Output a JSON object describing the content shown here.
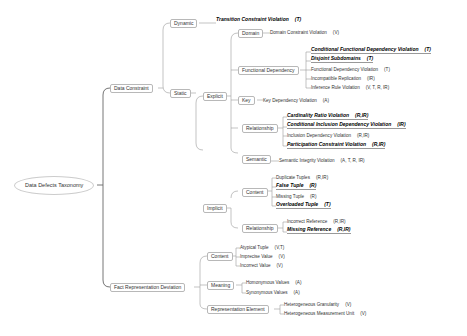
{
  "root": "Data Defects Taxonomy",
  "data_constraint": {
    "label": "Data Constraint",
    "dynamic": {
      "label": "Dynamic",
      "leaves": [
        {
          "text": "Transition Constraint Violation",
          "tag": "(T)",
          "bold": true
        }
      ]
    },
    "static": {
      "label": "Static",
      "explicit": {
        "label": "Explicit",
        "domain": {
          "label": "Domain",
          "leaves": [
            {
              "text": "Domain Constraint Violation",
              "tag": "(V)",
              "bold": false
            }
          ]
        },
        "functional_dependency": {
          "label": "Functional Dependency",
          "leaves": [
            {
              "text": "Conditional Functional Dependency Violation",
              "tag": "(T)",
              "bold": true
            },
            {
              "text": "Disjoint Subdomains",
              "tag": "(T)",
              "bold": true
            },
            {
              "text": "Functional Dependency Violation",
              "tag": "(T)",
              "bold": false
            },
            {
              "text": "Incompatible Replication",
              "tag": "(IR)",
              "bold": false
            },
            {
              "text": "Inference Rule Violation",
              "tag": "(V, T, R, IR)",
              "bold": false
            }
          ]
        },
        "key": {
          "label": "Key",
          "leaves": [
            {
              "text": "Key Dependency Violation",
              "tag": "(A)",
              "bold": false
            }
          ]
        },
        "relationship": {
          "label": "Relationship",
          "leaves": [
            {
              "text": "Cardinality Ratio Violation",
              "tag": "(R,IR)",
              "bold": true
            },
            {
              "text": "Conditional Inclusion Dependency Violation",
              "tag": "(IR)",
              "bold": true
            },
            {
              "text": "Inclusion Dependency Violation",
              "tag": "(R,IR)",
              "bold": false
            },
            {
              "text": "Participation Constraint Violation",
              "tag": "(R,IR)",
              "bold": true
            }
          ]
        },
        "semantic": {
          "label": "Semantic",
          "leaves": [
            {
              "text": "Semantic Integrity Violation",
              "tag": "(A, T, R, IR)",
              "bold": false
            }
          ]
        }
      },
      "implicit": {
        "label": "Implicit",
        "content": {
          "label": "Content",
          "leaves": [
            {
              "text": "Duplicate Tuples",
              "tag": "(R,IR)",
              "bold": false
            },
            {
              "text": "False Tuple",
              "tag": "(R)",
              "bold": true
            },
            {
              "text": "Missing Tuple",
              "tag": "(R)",
              "bold": false
            },
            {
              "text": "Overloaded Tuple",
              "tag": "(T)",
              "bold": true
            }
          ]
        },
        "relationship": {
          "label": "Relationship",
          "leaves": [
            {
              "text": "Incorrect Reference",
              "tag": "(R,IR)",
              "bold": false
            },
            {
              "text": "Missing Reference",
              "tag": "(R,IR)",
              "bold": true
            }
          ]
        }
      }
    }
  },
  "fact_representation_deviation": {
    "label": "Fact Representation Deviation",
    "content": {
      "label": "Content",
      "leaves": [
        {
          "text": "Atypical Tuple",
          "tag": "(V,T)",
          "bold": false
        },
        {
          "text": "Imprecise Value",
          "tag": "(V)",
          "bold": false
        },
        {
          "text": "Incorrect Value",
          "tag": "(V)",
          "bold": false
        }
      ]
    },
    "meaning": {
      "label": "Meaning",
      "leaves": [
        {
          "text": "Homonymous Values",
          "tag": "(A)",
          "bold": false
        },
        {
          "text": "Synonymous Values",
          "tag": "(A)",
          "bold": false
        }
      ]
    },
    "representation_element": {
      "label": "Representation Element",
      "leaves": [
        {
          "text": "Heterogeneous Granularity",
          "tag": "(V)",
          "bold": false
        },
        {
          "text": "Heterogeneous Measurement Unit",
          "tag": "(V)",
          "bold": false
        }
      ]
    }
  }
}
